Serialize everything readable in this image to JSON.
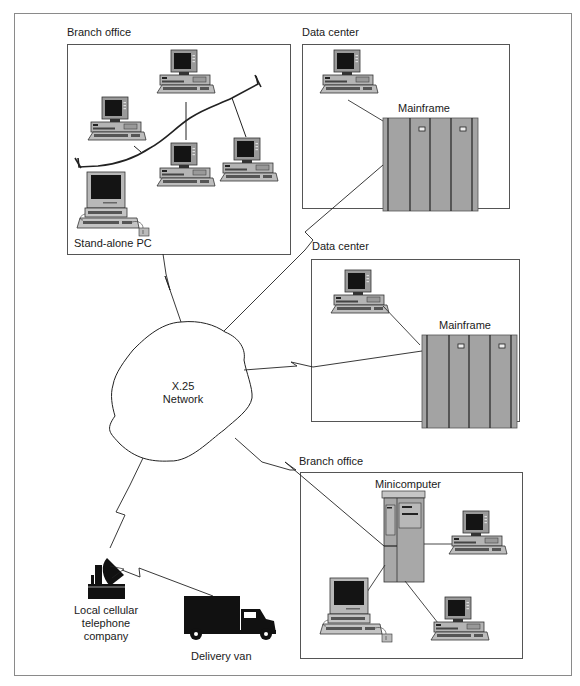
{
  "diagram": {
    "network": {
      "label_line1": "X.25",
      "label_line2": "Network"
    },
    "nodes": {
      "branch_office_top": {
        "label": "Branch office",
        "sub_label": "Stand-alone PC"
      },
      "data_center_1": {
        "label": "Data center",
        "mainframe_label": "Mainframe"
      },
      "data_center_2": {
        "label": "Data center",
        "mainframe_label": "Mainframe"
      },
      "branch_office_bottom": {
        "label": "Branch office",
        "minicomputer_label": "Minicomputer"
      },
      "cellular": {
        "label_line1": "Local cellular",
        "label_line2": "telephone",
        "label_line3": "company"
      },
      "van": {
        "label": "Delivery van"
      }
    },
    "connections": [
      {
        "from": "X.25 Network",
        "to": "Branch office (top)",
        "type": "leased line (lightning)"
      },
      {
        "from": "X.25 Network",
        "to": "Data center 1 mainframe",
        "type": "line"
      },
      {
        "from": "X.25 Network",
        "to": "Data center 2 mainframe",
        "type": "leased line (lightning)"
      },
      {
        "from": "X.25 Network",
        "to": "Branch office minicomputer",
        "type": "leased line (lightning)"
      },
      {
        "from": "X.25 Network",
        "to": "Local cellular telephone company",
        "type": "wireless (lightning)"
      },
      {
        "from": "Local cellular telephone company",
        "to": "Delivery van",
        "type": "wireless (lightning)"
      }
    ],
    "colors": {
      "line": "#222222",
      "frame": "#888888",
      "box": "#555555",
      "device_gray": "#a9a9a9",
      "device_light": "#c8c8c8",
      "screen": "#1a1a1a",
      "mainframe": "#a0a0a0"
    }
  }
}
